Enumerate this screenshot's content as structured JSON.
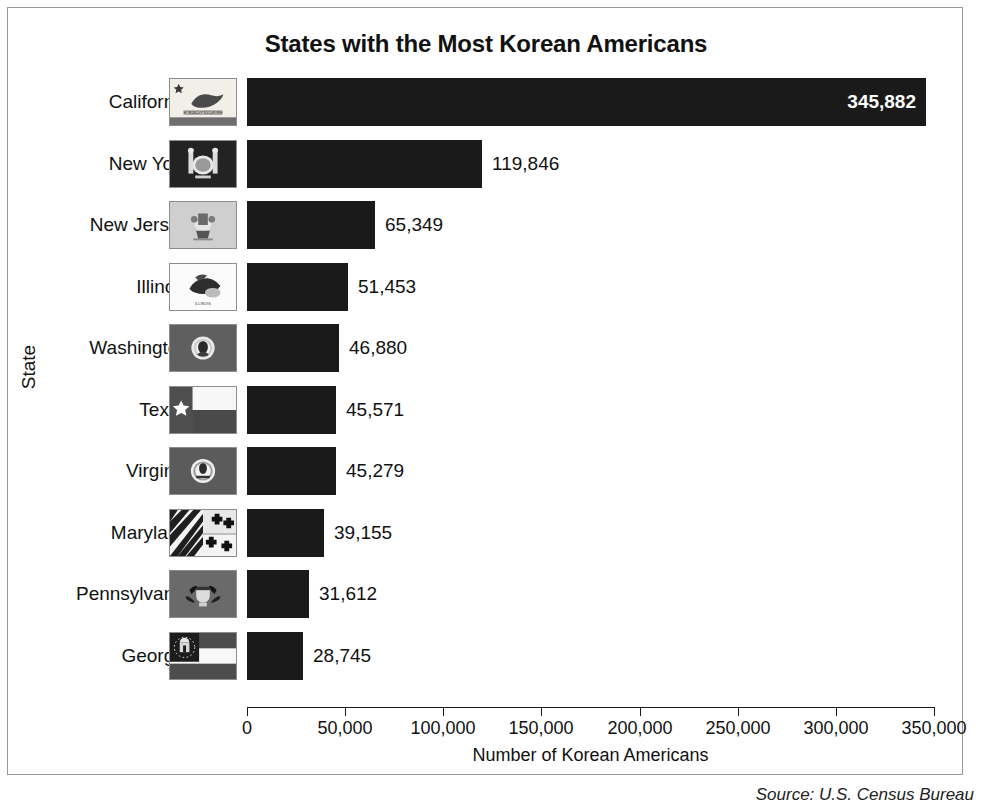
{
  "chart_data": {
    "type": "bar",
    "orientation": "horizontal",
    "title": "States with the Most Korean Americans",
    "xlabel": "Number of Korean Americans",
    "ylabel": "State",
    "categories": [
      "California",
      "New York",
      "New Jersey",
      "Illinois",
      "Washington",
      "Texas",
      "Virginia",
      "Maryland",
      "Pennsylvania",
      "Georgia"
    ],
    "values": [
      345882,
      119846,
      65349,
      51453,
      46880,
      45571,
      45279,
      39155,
      31612,
      28745
    ],
    "value_labels": [
      "345,882",
      "119,846",
      "65,349",
      "51,453",
      "46,880",
      "45,571",
      "45,279",
      "39,155",
      "31,612",
      "28,745"
    ],
    "xlim": [
      0,
      350000
    ],
    "xticks": [
      0,
      50000,
      100000,
      150000,
      200000,
      250000,
      300000,
      350000
    ],
    "xtick_labels": [
      "0",
      "50,000",
      "100,000",
      "150,000",
      "200,000",
      "250,000",
      "300,000",
      "350,000"
    ],
    "grid": false,
    "legend": null,
    "bar_color": "#1a1a1a",
    "inside_label_index": 0,
    "annotations": [
      "Each category row shows the state flag thumbnail between the state name and its bar."
    ]
  },
  "figure": {
    "source_note": "Source: U.S. Census Bureau",
    "border_color": "#9a9a9a",
    "background": "#ffffff"
  },
  "flags": [
    {
      "state": "California",
      "name": "california-flag",
      "motto": "CALIFORNIA REPUBLIC"
    },
    {
      "state": "New York",
      "name": "new-york-flag",
      "motto": ""
    },
    {
      "state": "New Jersey",
      "name": "new-jersey-flag",
      "motto": ""
    },
    {
      "state": "Illinois",
      "name": "illinois-flag",
      "motto": "ILLINOIS"
    },
    {
      "state": "Washington",
      "name": "washington-flag",
      "motto": ""
    },
    {
      "state": "Texas",
      "name": "texas-flag",
      "motto": ""
    },
    {
      "state": "Virginia",
      "name": "virginia-flag",
      "motto": ""
    },
    {
      "state": "Maryland",
      "name": "maryland-flag",
      "motto": ""
    },
    {
      "state": "Pennsylvania",
      "name": "pennsylvania-flag",
      "motto": ""
    },
    {
      "state": "Georgia",
      "name": "georgia-flag",
      "motto": ""
    }
  ]
}
